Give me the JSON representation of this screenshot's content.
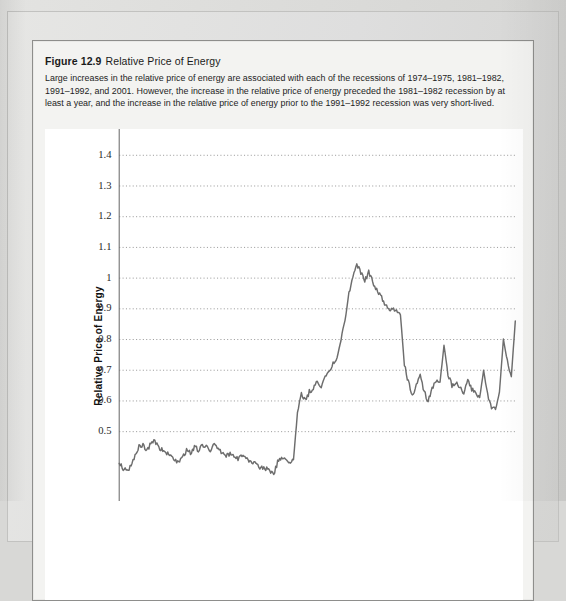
{
  "figure": {
    "number": "Figure 12.9",
    "title": "Relative Price of Energy",
    "caption": "Large increases in the relative price of energy are associated with each of the recessions of 1974–1975, 1981–1982, 1991–1992, and 2001. However, the increase in the relative price of energy preceded the 1981–1982 recession by at least a year, and the increase in the relative price of energy prior to the 1991–1992 recession was very short-lived."
  },
  "colors": {
    "series_line": "#6d6d6d",
    "gridline": "#9a9a9a",
    "axis": "#6e6e6e",
    "page_background": "#dcdcda",
    "figure_background": "#f3f3f1",
    "plot_background": "#ffffff",
    "text": "#1b1b1b"
  },
  "chart_data": {
    "type": "line",
    "title": "Relative Price of Energy",
    "xlabel": "",
    "ylabel": "Relative Price of Energy",
    "grid": true,
    "legend": "none",
    "ylim": [
      0.28,
      1.44
    ],
    "yticks": [
      0.5,
      0.6,
      0.7,
      0.8,
      0.9,
      1.0,
      1.1,
      1.2,
      1.3,
      1.4
    ],
    "ytick_labels": [
      "0.5",
      "0.6",
      "0.7",
      "0.8",
      "0.9",
      "1",
      "1.1",
      "1.2",
      "1.3",
      "1.4"
    ],
    "xlim": [
      0,
      100
    ],
    "xticks": [],
    "xtick_labels": [],
    "note": "Quarterly relative price of energy index; x axis runs left to right across the plotted sample. Vertical extent below 0.5 is cropped by the screenshot edge.",
    "series": [
      {
        "name": "Relative Price of Energy",
        "x": [
          0,
          1,
          2,
          3,
          4,
          5,
          6,
          7,
          8,
          9,
          10,
          11,
          12,
          13,
          14,
          15,
          16,
          17,
          18,
          19,
          20,
          21,
          22,
          23,
          24,
          25,
          26,
          27,
          28,
          29,
          30,
          31,
          32,
          33,
          34,
          35,
          36,
          37,
          38,
          39,
          40,
          41,
          42,
          43,
          44,
          45,
          46,
          47,
          48,
          49,
          50,
          51,
          52,
          53,
          54,
          55,
          56,
          57,
          58,
          59,
          60,
          61,
          62,
          63,
          64,
          65,
          66,
          67,
          68,
          69,
          70,
          71,
          72,
          73,
          74,
          75,
          76,
          77,
          78,
          79,
          80,
          81,
          82,
          83,
          84,
          85,
          86,
          87,
          88,
          89,
          90,
          91,
          92,
          93,
          94,
          95,
          96,
          97,
          98,
          99,
          100
        ],
        "values": [
          0.4,
          0.38,
          0.37,
          0.39,
          0.42,
          0.45,
          0.46,
          0.44,
          0.46,
          0.47,
          0.45,
          0.44,
          0.43,
          0.42,
          0.41,
          0.4,
          0.42,
          0.44,
          0.43,
          0.45,
          0.44,
          0.46,
          0.45,
          0.44,
          0.46,
          0.44,
          0.43,
          0.42,
          0.43,
          0.42,
          0.41,
          0.42,
          0.41,
          0.4,
          0.4,
          0.39,
          0.38,
          0.38,
          0.37,
          0.36,
          0.4,
          0.42,
          0.41,
          0.4,
          0.41,
          0.56,
          0.62,
          0.6,
          0.63,
          0.64,
          0.66,
          0.65,
          0.68,
          0.7,
          0.72,
          0.74,
          0.8,
          0.86,
          0.95,
          1.0,
          1.04,
          1.02,
          0.99,
          1.02,
          0.99,
          0.96,
          0.94,
          0.92,
          0.9,
          0.9,
          0.89,
          0.88,
          0.72,
          0.66,
          0.62,
          0.65,
          0.68,
          0.63,
          0.6,
          0.64,
          0.67,
          0.66,
          0.78,
          0.69,
          0.65,
          0.66,
          0.64,
          0.63,
          0.67,
          0.64,
          0.62,
          0.61,
          0.7,
          0.62,
          0.58,
          0.57,
          0.63,
          0.8,
          0.73,
          0.68,
          0.86
        ]
      }
    ],
    "dense_series_note": "The plotted line is high-frequency (monthly) and noisy; rendered path approximates the visible trace."
  }
}
